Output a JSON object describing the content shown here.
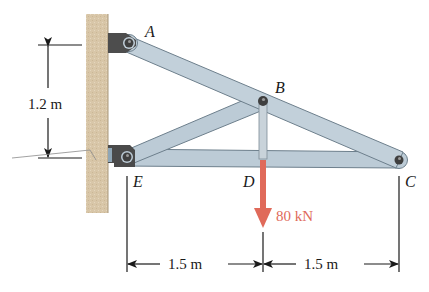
{
  "diagram": {
    "type": "truss-frame",
    "colors": {
      "wall": "#d8c6a8",
      "member_fill": "#b9c9d4",
      "member_edge": "#6d7f8c",
      "pin": "#3f3f3f",
      "bracket": "#4a4a4a",
      "load_arrow": "#e06a5a",
      "dimension_line": "#1a1a1a"
    },
    "points": {
      "A": {
        "label": "A",
        "x": 129,
        "y": 43
      },
      "B": {
        "label": "B",
        "x": 263,
        "y": 101
      },
      "C": {
        "label": "C",
        "x": 399,
        "y": 160
      },
      "D": {
        "label": "D",
        "x": 263,
        "y": 160
      },
      "E": {
        "label": "E",
        "x": 127,
        "y": 157
      }
    },
    "members": [
      {
        "name": "AC",
        "from": "A",
        "to": "C"
      },
      {
        "name": "EB",
        "from": "E",
        "to": "B"
      },
      {
        "name": "EC",
        "from": "E",
        "to": "C"
      },
      {
        "name": "BD",
        "from": "B",
        "to": "D"
      }
    ],
    "load": {
      "label": "80 kN",
      "at": "D",
      "direction": "down"
    },
    "dimensions": {
      "vertical": {
        "label": "1.2 m",
        "between": [
          "A",
          "E"
        ]
      },
      "horizontal_left": {
        "label": "1.5 m",
        "between": [
          "E",
          "D"
        ]
      },
      "horizontal_right": {
        "label": "1.5 m",
        "between": [
          "D",
          "C"
        ]
      }
    }
  }
}
